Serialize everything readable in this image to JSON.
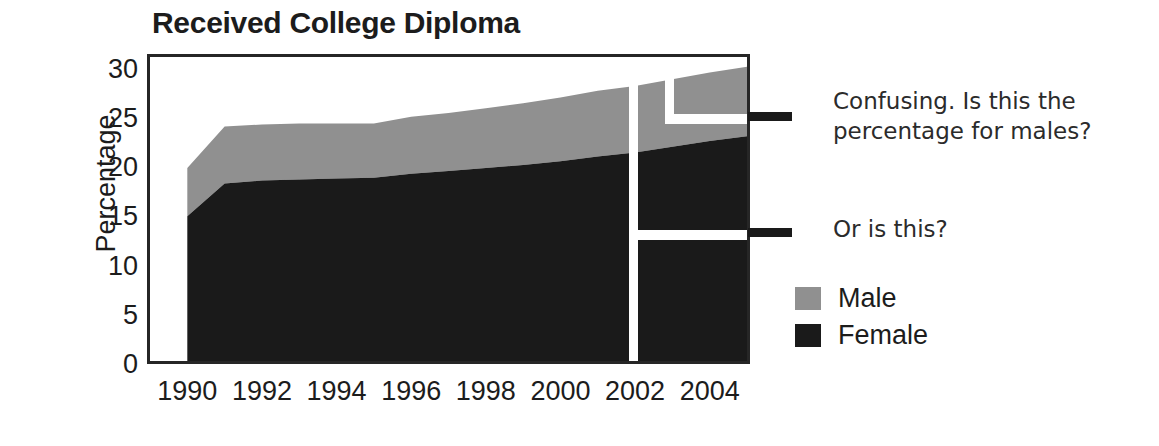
{
  "chart_data": {
    "type": "area",
    "title": "Received College Diploma",
    "xlabel": "",
    "ylabel": "Percentage",
    "stacked": true,
    "grid": false,
    "legend_position": "right",
    "xlim": [
      1989,
      2005
    ],
    "ylim": [
      0,
      31.5
    ],
    "yticks": [
      0,
      5,
      10,
      15,
      20,
      25,
      30
    ],
    "xticks": [
      1990,
      1992,
      1994,
      1996,
      1998,
      2000,
      2002,
      2004
    ],
    "x": [
      1990,
      1991,
      1992,
      1993,
      1994,
      1995,
      1996,
      1997,
      1998,
      1999,
      2000,
      2001,
      2002,
      2003,
      2004,
      2005
    ],
    "series": [
      {
        "name": "Female",
        "color": "#1a1a1a",
        "values": [
          15.0,
          18.4,
          18.7,
          18.8,
          18.9,
          19.0,
          19.4,
          19.7,
          20.0,
          20.3,
          20.7,
          21.2,
          21.6,
          22.2,
          22.8,
          23.3
        ]
      },
      {
        "name": "Male",
        "color": "#909090",
        "values": [
          5.0,
          5.9,
          5.8,
          5.8,
          5.7,
          5.6,
          5.9,
          6.0,
          6.2,
          6.4,
          6.6,
          6.8,
          6.9,
          7.0,
          7.1,
          7.2
        ]
      }
    ],
    "stacked_totals": [
      20.0,
      24.3,
      24.5,
      24.6,
      24.6,
      24.6,
      25.3,
      25.7,
      26.2,
      26.7,
      27.3,
      28.0,
      28.5,
      29.2,
      29.9,
      30.5
    ],
    "annotations": [
      {
        "id": "males-question",
        "text": "Confusing. Is this the\npercentage for males?",
        "points_to_value": 25.4
      },
      {
        "id": "or-is-this",
        "text": "Or is this?",
        "points_to_value": 12.6
      }
    ]
  },
  "legend": {
    "items": [
      {
        "label": "Male",
        "color": "#909090"
      },
      {
        "label": "Female",
        "color": "#1a1a1a"
      }
    ]
  },
  "notes": {
    "males_question": "Confusing. Is this the\npercentage for males?",
    "or_is_this": "Or is this?"
  },
  "colors": {
    "male": "#909090",
    "female": "#1a1a1a",
    "axis": "#262626",
    "background": "#ffffff",
    "text": "#1c1c1c"
  }
}
